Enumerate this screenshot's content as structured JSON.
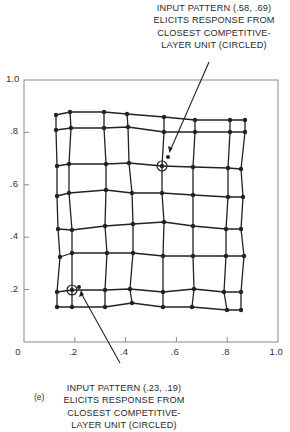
{
  "figure": {
    "panel_label": "(e)",
    "frame": {
      "x0_px": 24,
      "x1_px": 278,
      "y_top_px": 80,
      "y_bottom_px": 342,
      "color": "#8a8a8a"
    },
    "line_color": "#222222",
    "x_axis": {
      "ticks": [
        {
          "label": "0",
          "value": 0.0
        },
        {
          "label": ".2",
          "value": 0.2
        },
        {
          "label": ".4",
          "value": 0.4
        },
        {
          "label": ".6",
          "value": 0.6
        },
        {
          "label": ".8",
          "value": 0.8
        },
        {
          "label": "1.0",
          "value": 1.0
        }
      ]
    },
    "y_axis": {
      "ticks": [
        {
          "label": "1.0",
          "value": 1.0
        },
        {
          "label": ".8",
          "value": 0.8
        },
        {
          "label": ".6",
          "value": 0.6
        },
        {
          "label": ".4",
          "value": 0.4
        },
        {
          "label": ".2",
          "value": 0.2
        }
      ]
    },
    "grid_nodes_px": [
      [
        [
          56,
          115
        ],
        [
          70,
          112
        ],
        [
          104,
          112
        ],
        [
          127,
          114
        ],
        [
          164,
          117
        ],
        [
          195,
          120
        ],
        [
          230,
          120
        ],
        [
          245,
          120
        ]
      ],
      [
        [
          56,
          130
        ],
        [
          71,
          128
        ],
        [
          104,
          128
        ],
        [
          128,
          127
        ],
        [
          164,
          132
        ],
        [
          195,
          132
        ],
        [
          230,
          132
        ],
        [
          245,
          132
        ]
      ],
      [
        [
          57,
          166
        ],
        [
          69,
          164
        ],
        [
          106,
          164
        ],
        [
          129,
          163
        ],
        [
          162,
          166
        ],
        [
          193,
          167
        ],
        [
          228,
          168
        ],
        [
          241,
          169
        ]
      ],
      [
        [
          57,
          196
        ],
        [
          69,
          193
        ],
        [
          106,
          190
        ],
        [
          132,
          193
        ],
        [
          162,
          193
        ],
        [
          193,
          195
        ],
        [
          228,
          197
        ],
        [
          243,
          197
        ]
      ],
      [
        [
          58,
          229
        ],
        [
          72,
          230
        ],
        [
          105,
          226
        ],
        [
          133,
          224
        ],
        [
          164,
          222
        ],
        [
          193,
          226
        ],
        [
          226,
          229
        ],
        [
          241,
          229
        ]
      ],
      [
        [
          60,
          257
        ],
        [
          72,
          253
        ],
        [
          107,
          253
        ],
        [
          133,
          253
        ],
        [
          163,
          256
        ],
        [
          193,
          256
        ],
        [
          226,
          256
        ],
        [
          244,
          256
        ]
      ],
      [
        [
          57,
          292
        ],
        [
          72,
          290
        ],
        [
          105,
          290
        ],
        [
          130,
          289
        ],
        [
          163,
          292
        ],
        [
          194,
          289
        ],
        [
          224,
          292
        ],
        [
          241,
          292
        ]
      ],
      [
        [
          57,
          307
        ],
        [
          72,
          307
        ],
        [
          105,
          307
        ],
        [
          132,
          303
        ],
        [
          163,
          307
        ],
        [
          192,
          307
        ],
        [
          227,
          310
        ],
        [
          241,
          310
        ]
      ]
    ],
    "highlighted_units": [
      {
        "name": "top-circled-unit",
        "cx": 162,
        "cy": 166,
        "r": 5
      },
      {
        "name": "bottom-circled-unit",
        "cx": 72,
        "cy": 290,
        "r": 5
      }
    ],
    "input_points": [
      {
        "name": "input-pattern-58-69",
        "x": 0.58,
        "y": 0.69,
        "cx": 168,
        "cy": 157
      },
      {
        "name": "input-pattern-23-19",
        "x": 0.23,
        "y": 0.19,
        "cx": 79,
        "cy": 287
      }
    ],
    "leader_lines": [
      {
        "name": "top-callout-leader",
        "x1": 209,
        "y1": 62,
        "x2": 170,
        "y2": 151
      },
      {
        "name": "bottom-callout-leader",
        "x1": 81,
        "y1": 293,
        "x2": 120,
        "y2": 363
      }
    ]
  },
  "callouts": {
    "top": {
      "lines": [
        "INPUT PATTERN (.58, .69)",
        "ELICITS RESPONSE FROM",
        "CLOSEST COMPETITIVE-",
        "LAYER UNIT (CIRCLED)"
      ]
    },
    "bottom": {
      "lines": [
        "INPUT PATTERN (.23, .19)",
        "ELICITS RESPONSE FROM",
        "CLOSEST COMPETITIVE-",
        "LAYER UNIT (CIRCLED)"
      ]
    }
  }
}
